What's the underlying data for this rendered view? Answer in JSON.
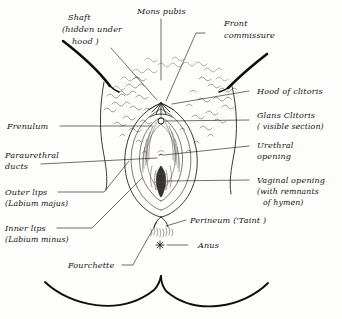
{
  "figure": {
    "style": "hand-drawn pen and ink line illustration with handwritten italic labels",
    "ink_color": "#1b1714",
    "paper_color": "#fdfdfc",
    "hair_texture_color": "#6b645d"
  },
  "labels": {
    "mons_pubis": "Mons pubis",
    "shaft_line1": "Shaft",
    "shaft_line2": "(hidden under",
    "shaft_line3": "hood )",
    "front_commissure_line1": "Front",
    "front_commissure_line2": "commissure",
    "hood_of_clitoris": "Hood of clitoris",
    "glans_clitoris_line1": "Glans  Clitoris",
    "glans_clitoris_line2": "( visible section)",
    "urethral_opening_line1": "Urethral",
    "urethral_opening_line2": "opening",
    "vaginal_opening_line1": "Vaginal opening",
    "vaginal_opening_line2": "(with remnants",
    "vaginal_opening_line3": "of hymen)",
    "frenulum": "Frenulum",
    "paraurethral_line1": "Paraurethral",
    "paraurethral_line2": "ducts",
    "outer_lips_line1": "Outer lips",
    "outer_lips_line2": "(Labium majus)",
    "inner_lips_line1": "Inner lips",
    "inner_lips_line2": "(Labium minus)",
    "perineum": "Perineum ('Taint )",
    "anus": "Anus",
    "fourchette": "Fourchette"
  },
  "parts": {
    "mons_pubis": "mons-pubis-region",
    "pubic_hair": "pubic-hair-stipple",
    "clitoral_hood": "clitoral-hood",
    "glans_clitoris": "glans-clitoris-marker",
    "urethral_opening": "urethral-opening-marker",
    "vaginal_opening": "vaginal-opening-with-hymen",
    "outer_labia": "labium-majus-contour",
    "inner_labia": "labium-minus-contour",
    "perineum": "perineum-region",
    "anus": "anus-starburst",
    "fourchette": "fourchette-point",
    "thighs": "inner-thigh-curves"
  }
}
